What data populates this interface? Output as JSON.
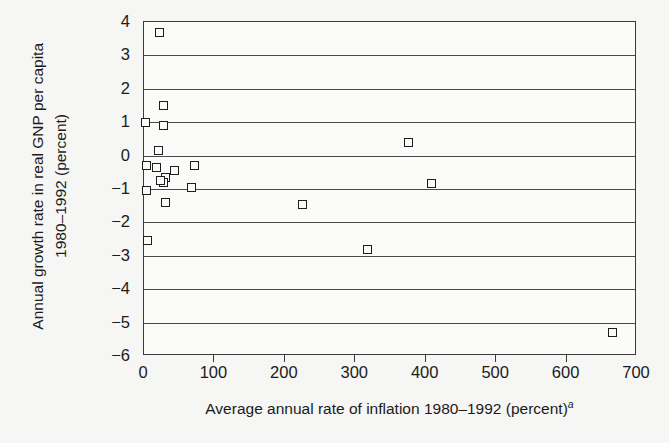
{
  "chart_data": {
    "type": "scatter",
    "title": "",
    "xlabel": "Average annual rate of inflation 1980–1992 (percent)",
    "xlabel_superscript": "a",
    "ylabel_line1": "Annual growth rate in real GNP per capita",
    "ylabel_line2": "1980–1992 (percent)",
    "xlim": [
      0,
      700
    ],
    "ylim": [
      -6,
      4
    ],
    "xticks": [
      0,
      100,
      200,
      300,
      400,
      500,
      600,
      700
    ],
    "yticks": [
      4,
      3,
      2,
      1,
      0,
      -1,
      -2,
      -3,
      -4,
      -5,
      -6
    ],
    "xtick_labels": [
      "0",
      "100",
      "200",
      "300",
      "400",
      "500",
      "600",
      "700"
    ],
    "ytick_labels": [
      "4",
      "3",
      "2",
      "1",
      "0",
      "−1",
      "−2",
      "−3",
      "−4",
      "−5",
      "−6"
    ],
    "grid": "horizontal",
    "legend": "none",
    "marker": "open-square",
    "marker_color": "#1e1e1e",
    "points": [
      {
        "x": 22,
        "y": 3.7
      },
      {
        "x": 28,
        "y": 1.5
      },
      {
        "x": 2,
        "y": 1.0
      },
      {
        "x": 27,
        "y": 0.9
      },
      {
        "x": 20,
        "y": 0.15
      },
      {
        "x": 3,
        "y": -0.3
      },
      {
        "x": 18,
        "y": -0.35
      },
      {
        "x": 43,
        "y": -0.45
      },
      {
        "x": 72,
        "y": -0.3
      },
      {
        "x": 30,
        "y": -0.65
      },
      {
        "x": 28,
        "y": -0.8
      },
      {
        "x": 24,
        "y": -0.75
      },
      {
        "x": 3,
        "y": -1.05
      },
      {
        "x": 30,
        "y": -1.4
      },
      {
        "x": 68,
        "y": -0.95
      },
      {
        "x": 5,
        "y": -2.55
      },
      {
        "x": 225,
        "y": -1.45
      },
      {
        "x": 317,
        "y": -2.8
      },
      {
        "x": 375,
        "y": 0.4
      },
      {
        "x": 408,
        "y": -0.85
      },
      {
        "x": 665,
        "y": -5.3
      }
    ]
  }
}
